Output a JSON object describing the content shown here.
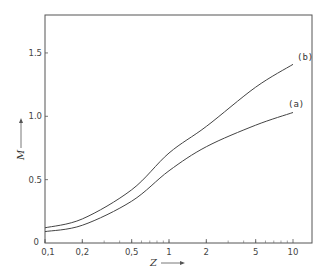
{
  "chart_data": {
    "type": "line",
    "title": "",
    "xlabel": "Z",
    "ylabel": "M",
    "xscale": "log",
    "xlim": [
      0.1,
      10
    ],
    "ylim": [
      0,
      1.78
    ],
    "grid": false,
    "legend": "inline labels at curve ends",
    "x_ticks": [
      0.1,
      0.2,
      0.5,
      1,
      2,
      5,
      10
    ],
    "x_tick_labels": [
      "0,1",
      "0,2",
      "0,5",
      "1",
      "2",
      "5",
      "10"
    ],
    "y_ticks": [
      0,
      0.5,
      1.0,
      1.5
    ],
    "y_tick_labels": [
      "0",
      "0.5",
      "1.0",
      "1.5"
    ],
    "x": [
      0.1,
      0.2,
      0.5,
      1,
      2,
      5,
      10
    ],
    "series": [
      {
        "name": "(a)",
        "values": [
          0.09,
          0.14,
          0.33,
          0.57,
          0.76,
          0.93,
          1.03
        ]
      },
      {
        "name": "(b)",
        "values": [
          0.12,
          0.19,
          0.42,
          0.71,
          0.92,
          1.23,
          1.41
        ]
      }
    ]
  },
  "labels": {
    "x_axis": "Z",
    "y_axis": "M",
    "series_a": "(a)",
    "series_b": "(b)",
    "origin_y": "0"
  }
}
